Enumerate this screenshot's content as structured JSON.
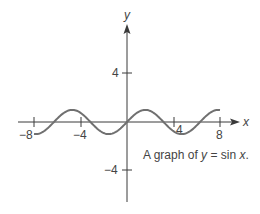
{
  "chart_data": {
    "type": "line",
    "title": "",
    "function": "y = sin x",
    "xlabel": "x",
    "ylabel": "y",
    "xlim": [
      -8,
      8
    ],
    "ylim": [
      -6.5,
      8
    ],
    "x_ticks": [
      -8,
      -4,
      4,
      8
    ],
    "x_tick_labels": [
      "−8",
      "−4",
      "4",
      "8"
    ],
    "y_ticks": [
      4,
      -4
    ],
    "y_tick_labels": [
      "4",
      "−4"
    ],
    "grid": false,
    "legend": null,
    "annotations": [
      {
        "text_parts": [
          "A graph of ",
          "y",
          " = sin ",
          "x",
          "."
        ],
        "x": 2.5,
        "y": -3
      }
    ],
    "series": [
      {
        "name": "sin x",
        "color": "#707070",
        "x": [
          -8,
          -7,
          -6,
          -5,
          -4,
          -3,
          -2,
          -1,
          0,
          1,
          2,
          3,
          4,
          5,
          6,
          7,
          8
        ],
        "values": [
          -0.989,
          -0.657,
          0.279,
          0.959,
          0.757,
          -0.141,
          -0.909,
          -0.841,
          0,
          0.841,
          0.909,
          0.141,
          -0.757,
          -0.959,
          -0.279,
          0.657,
          0.989
        ]
      }
    ]
  },
  "axes": {
    "x_label": "x",
    "y_label": "y",
    "tick_minus8": "−8",
    "tick_minus4": "−4",
    "tick_4": "4",
    "tick_8": "8",
    "ytick_4": "4",
    "ytick_minus4": "−4"
  },
  "caption": {
    "prefix": "A graph of ",
    "var_y": "y",
    "middle": " = sin ",
    "var_x": "x",
    "suffix": "."
  },
  "colors": {
    "axis": "#3a3a3a",
    "curve": "#707070",
    "text": "#444444"
  }
}
